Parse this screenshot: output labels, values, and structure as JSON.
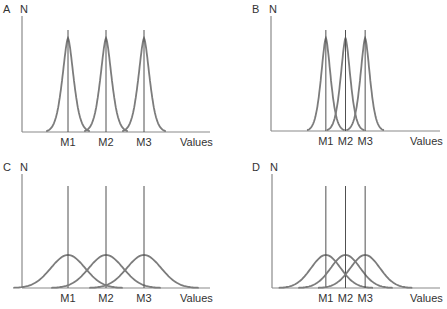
{
  "chart_data": [
    {
      "type": "line",
      "panel": "A",
      "description": "Three narrow, well-separated distributions",
      "ylabel": "N",
      "xlabel": "Values",
      "means": [
        {
          "label": "M1",
          "x": 1
        },
        {
          "label": "M2",
          "x": 2
        },
        {
          "label": "M3",
          "x": 3
        }
      ],
      "spread": "narrow",
      "sd": 0.18,
      "peak": 0.82,
      "xlim": [
        -0.2,
        4.2
      ],
      "ylim": [
        0,
        1
      ]
    },
    {
      "type": "line",
      "panel": "B",
      "description": "Three narrow distributions with close means",
      "ylabel": "N",
      "xlabel": "Values",
      "means": [
        {
          "label": "M1",
          "x": 1.4
        },
        {
          "label": "M2",
          "x": 2
        },
        {
          "label": "M3",
          "x": 2.6
        }
      ],
      "spread": "narrow",
      "sd": 0.18,
      "peak": 0.82,
      "xlim": [
        -0.2,
        4.2
      ],
      "ylim": [
        0,
        1
      ]
    },
    {
      "type": "line",
      "panel": "C",
      "description": "Three wide distributions with separated means",
      "ylabel": "N",
      "xlabel": "Values",
      "means": [
        {
          "label": "M1",
          "x": 1
        },
        {
          "label": "M2",
          "x": 2
        },
        {
          "label": "M3",
          "x": 3
        }
      ],
      "spread": "wide",
      "sd": 0.45,
      "peak": 0.3,
      "xlim": [
        -0.2,
        4.2
      ],
      "ylim": [
        0,
        1
      ]
    },
    {
      "type": "line",
      "panel": "D",
      "description": "Three wide distributions with close means",
      "ylabel": "N",
      "xlabel": "Values",
      "means": [
        {
          "label": "M1",
          "x": 1.4
        },
        {
          "label": "M2",
          "x": 2
        },
        {
          "label": "M3",
          "x": 2.6
        }
      ],
      "spread": "wide",
      "sd": 0.45,
      "peak": 0.3,
      "xlim": [
        -0.2,
        4.2
      ],
      "ylim": [
        0,
        1
      ]
    }
  ],
  "colors": {
    "curve": "#7c7c7c",
    "mean_line": "#505050",
    "axis": "#8a8a8a",
    "text": "#333333"
  }
}
